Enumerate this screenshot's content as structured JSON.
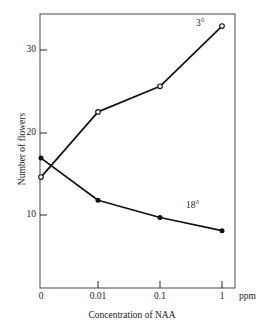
{
  "chart_data": {
    "type": "line",
    "title": "",
    "xlabel": "Concentration of NAA",
    "ylabel": "Number of flowers",
    "x_unit": "ppm",
    "categories": [
      "0",
      "0.01",
      "0.1",
      "1"
    ],
    "xtick_labels": [
      "0",
      "0.01",
      "0.1",
      "1"
    ],
    "ytick_labels": [
      "30",
      "20",
      "10"
    ],
    "ytick_values": [
      30,
      20,
      10
    ],
    "ylim": [
      0,
      35.5
    ],
    "xlim": [
      0,
      3.4
    ],
    "grid": false,
    "legend_position": "inline-annotation",
    "series": [
      {
        "name": "3°",
        "marker": "open-circle",
        "values": [
          14.6,
          22.5,
          25.6,
          32.9
        ]
      },
      {
        "name": "18°",
        "marker": "filled-circle",
        "values": [
          16.9,
          11.8,
          9.7,
          8.1
        ]
      }
    ],
    "annotations": [
      {
        "text": "3°",
        "series": "3°"
      },
      {
        "text": "18°",
        "series": "18°"
      }
    ],
    "colors": {
      "line": "#111111",
      "frame": "#555555",
      "text": "#1a1a1a"
    }
  },
  "axis": {
    "ytick_0": "30",
    "ytick_1": "20",
    "ytick_2": "10",
    "xtick_0": "0",
    "xtick_1": "0.01",
    "xtick_2": "0.1",
    "xtick_3": "1",
    "unit": "ppm",
    "x_title": "Concentration of NAA",
    "y_title": "Number of flowers"
  },
  "labels": {
    "cold": "3°",
    "warm": "18°"
  }
}
